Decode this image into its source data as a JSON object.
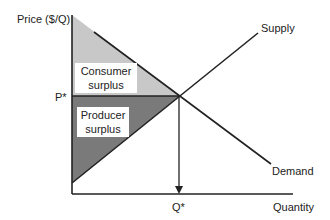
{
  "diagram": {
    "axes": {
      "y_label": "Price ($/Q)",
      "x_label": "Quantity"
    },
    "curves": {
      "supply": "Supply",
      "demand": "Demand"
    },
    "equilibrium": {
      "price_label": "P*",
      "quantity_label": "Q*"
    },
    "regions": {
      "consumer": {
        "line1": "Consumer",
        "line2": "surplus",
        "color": "#c8c8c8"
      },
      "producer": {
        "line1": "Producer",
        "line2": "surplus",
        "color": "#7a7a7a"
      }
    }
  }
}
